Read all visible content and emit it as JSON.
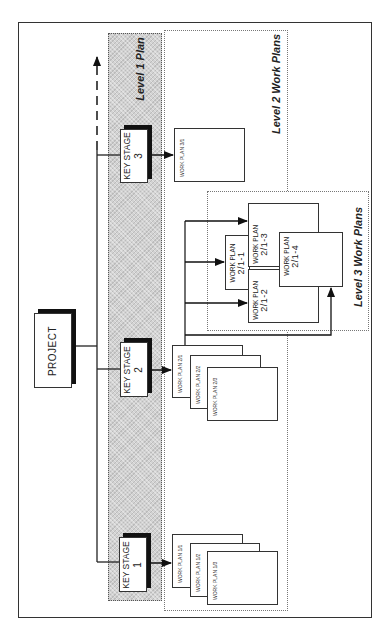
{
  "diagram": {
    "project": {
      "label": "PROJECT"
    },
    "groups": {
      "level1": "Level 1 Plan",
      "level2": "Level 2 Work Plans",
      "level3": "Level 3 Work Plans"
    },
    "key_stages": [
      {
        "title": "KEY STAGE",
        "number": "1"
      },
      {
        "title": "KEY STAGE",
        "number": "2"
      },
      {
        "title": "KEY STAGE",
        "number": "3"
      }
    ],
    "level2_work_plans": {
      "stage1": [
        "WORK PLAN 1/1",
        "WORK PLAN 1/2",
        "WORK PLAN 1/3"
      ],
      "stage2": [
        "WORK PLAN 2/1",
        "WORK PLAN 2/2",
        "WORK PLAN 2/3"
      ],
      "stage3": [
        "WORK PLAN 3/1"
      ]
    },
    "level3_work_plans": [
      {
        "title": "WORK PLAN",
        "code": "2/1-1"
      },
      {
        "title": "WORK PLAN",
        "code": "2/1-2"
      },
      {
        "title": "WORK PLAN",
        "code": "2/1-3"
      },
      {
        "title": "WORK PLAN",
        "code": "2/1-4"
      }
    ]
  }
}
